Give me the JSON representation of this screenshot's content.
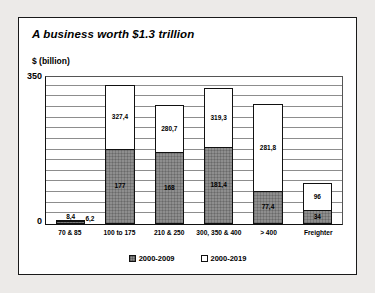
{
  "card": {
    "title": "A business worth $1.3 trillion"
  },
  "chart_data": {
    "type": "bar",
    "subtype": "stacked-bar",
    "title": "A business worth $1.3 trillion",
    "xlabel": "",
    "ylabel": "$ (billion)",
    "ylim": [
      0,
      350
    ],
    "yticks": [
      "0",
      "350"
    ],
    "grid": true,
    "gridline_interval": 25,
    "legend_position": "bottom",
    "categories": [
      "70 & 85",
      "100 to 175",
      "210 & 250",
      "300, 350 & 400",
      "> 400",
      "Freighter"
    ],
    "series": [
      {
        "name": "2000-2009",
        "color": "#8e8e8e",
        "values": [
          6.2,
          177,
          168,
          181.4,
          77.4,
          34
        ],
        "labels": [
          "6,2",
          "177",
          "168",
          "181,4",
          "77,4",
          "34"
        ]
      },
      {
        "name": "2000-2019",
        "color": "#ffffff",
        "values": [
          8.4,
          327.4,
          280.7,
          319.3,
          281.8,
          96
        ],
        "labels": [
          "8,4",
          "327,4",
          "280,7",
          "319,3",
          "281,8",
          "96"
        ]
      }
    ]
  },
  "legend": [
    {
      "label": "2000-2009",
      "swatch": "gray"
    },
    {
      "label": "2000-2019",
      "swatch": "white"
    }
  ]
}
